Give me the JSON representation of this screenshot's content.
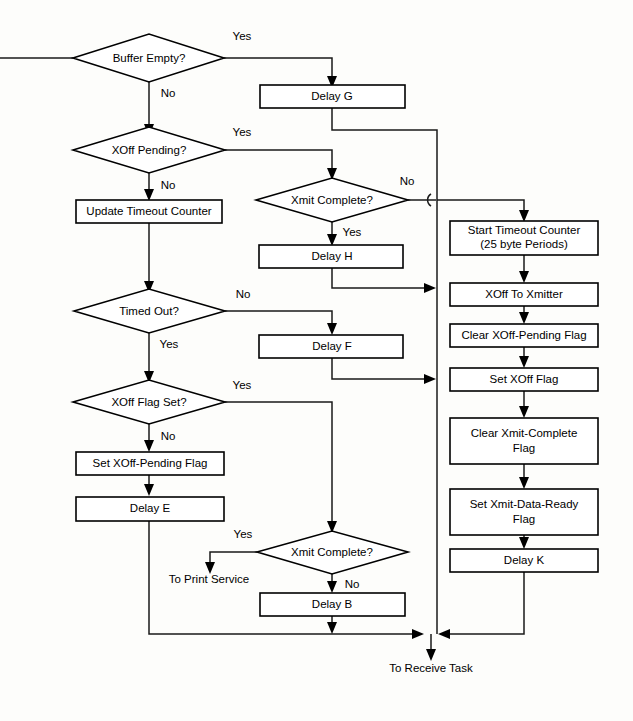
{
  "diagram": {
    "colors": {
      "background": "#fdfdfb",
      "stroke": "#1a1a1a",
      "shape_fill": "#ffffff",
      "text": "#000000"
    },
    "decisions": [
      {
        "id": "buffer-empty",
        "label": "Buffer Empty?"
      },
      {
        "id": "xoff-pending",
        "label": "XOff Pending?"
      },
      {
        "id": "xmit-complete-top",
        "label": "Xmit Complete?"
      },
      {
        "id": "timed-out",
        "label": "Timed Out?"
      },
      {
        "id": "xoff-flag-set",
        "label": "XOff Flag Set?"
      },
      {
        "id": "xmit-complete-bottom",
        "label": "Xmit Complete?"
      }
    ],
    "processes": [
      {
        "id": "delay-g",
        "label": "Delay G"
      },
      {
        "id": "update-timeout-counter",
        "label": "Update Timeout Counter"
      },
      {
        "id": "delay-h",
        "label": "Delay H"
      },
      {
        "id": "delay-f",
        "label": "Delay F"
      },
      {
        "id": "set-xoff-pending-flag",
        "label": "Set XOff-Pending Flag"
      },
      {
        "id": "delay-e",
        "label": "Delay E"
      },
      {
        "id": "delay-b",
        "label": "Delay B"
      },
      {
        "id": "start-timeout-counter",
        "label_line1": "Start Timeout Counter",
        "label_line2": "(25 byte Periods)"
      },
      {
        "id": "xoff-to-xmitter",
        "label": "XOff To Xmitter"
      },
      {
        "id": "clear-xoff-pending-flag",
        "label": "Clear XOff-Pending Flag"
      },
      {
        "id": "set-xoff-flag",
        "label": "Set XOff Flag"
      },
      {
        "id": "clear-xmit-complete-flag",
        "label_line1": "Clear Xmit-Complete",
        "label_line2": "Flag"
      },
      {
        "id": "set-xmit-data-ready-flag",
        "label_line1": "Set Xmit-Data-Ready",
        "label_line2": "Flag"
      },
      {
        "id": "delay-k",
        "label": "Delay K"
      }
    ],
    "edge_labels": {
      "buffer_empty_yes": "Yes",
      "buffer_empty_no": "No",
      "xoff_pending_yes": "Yes",
      "xoff_pending_no": "No",
      "xmit_complete_top_no": "No",
      "xmit_complete_top_yes": "Yes",
      "timed_out_no": "No",
      "timed_out_yes": "Yes",
      "xoff_flag_set_yes": "Yes",
      "xoff_flag_set_no": "No",
      "xmit_complete_bottom_yes": "Yes",
      "xmit_complete_bottom_no": "No"
    },
    "terminals": [
      {
        "id": "to-print-service",
        "label": "To Print Service"
      },
      {
        "id": "to-receive-task",
        "label": "To Receive Task"
      }
    ]
  }
}
